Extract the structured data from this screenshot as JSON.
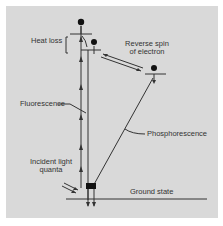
{
  "diagram": {
    "type": "energy-level-diagram",
    "labels": {
      "heat_loss": "Heat loss",
      "reverse_spin_line1": "Reverse spin",
      "reverse_spin_line2": "of electron",
      "fluorescence": "Fluorescence",
      "phosphorescence": "Phosphorescence",
      "incident_line1": "Incident light",
      "incident_line2": "quanta",
      "ground_state": "Ground state"
    },
    "colors": {
      "background": "#d9d9d9",
      "line": "#333333",
      "electron": "#111111"
    }
  }
}
